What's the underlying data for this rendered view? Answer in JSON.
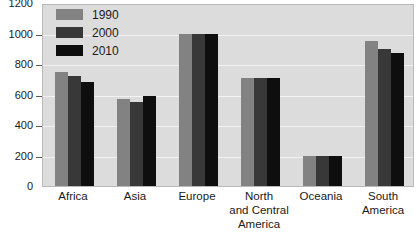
{
  "chart_data": {
    "type": "bar",
    "title": "",
    "xlabel": "",
    "ylabel": "",
    "ylim": [
      0,
      1200
    ],
    "yticks": [
      0,
      200,
      400,
      600,
      800,
      1000,
      1200
    ],
    "ytick_labels": [
      "0",
      "200",
      "400",
      "600",
      "800",
      "1000",
      "1200"
    ],
    "grid": true,
    "legend_position": "top-left",
    "categories": [
      "Africa",
      "Asia",
      "Europe",
      "North and Central America",
      "Oceania",
      "South America"
    ],
    "category_label_lines": [
      [
        "Africa"
      ],
      [
        "Asia"
      ],
      [
        "Europe"
      ],
      [
        "North",
        "and Central",
        "America"
      ],
      [
        "Oceania"
      ],
      [
        "South",
        "America"
      ]
    ],
    "series": [
      {
        "name": "1990",
        "color": "#828282",
        "values": [
          750,
          570,
          1000,
          710,
          200,
          950
        ]
      },
      {
        "name": "2000",
        "color": "#383838",
        "values": [
          720,
          550,
          1000,
          710,
          200,
          900
        ]
      },
      {
        "name": "2010",
        "color": "#0e0e0e",
        "values": [
          680,
          590,
          1000,
          710,
          200,
          870
        ]
      }
    ],
    "plot_background": "#dcdcdc",
    "gridline_color": "#f2f2f2"
  }
}
